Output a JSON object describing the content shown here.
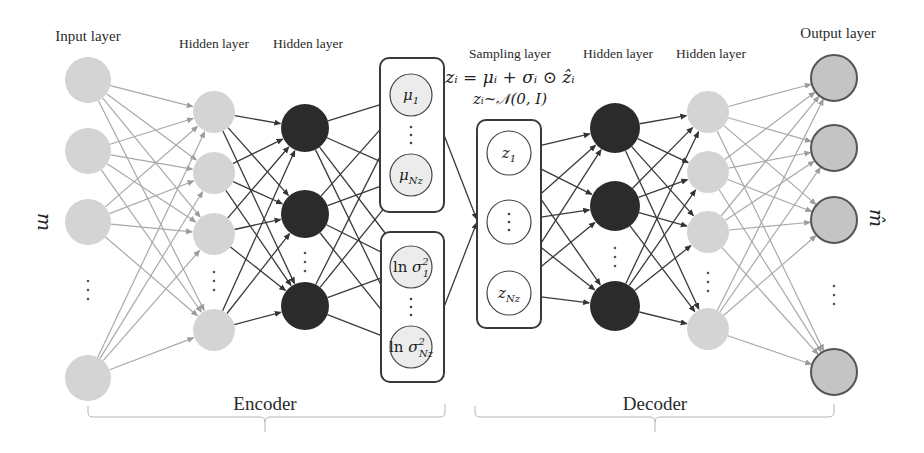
{
  "title_labels": {
    "input": "Input layer",
    "enc_hidden1": "Hidden layer",
    "enc_hidden2": "Hidden layer",
    "sampling": "Sampling layer",
    "dec_hidden1": "Hidden layer",
    "dec_hidden2": "Hidden layer",
    "output": "Output layer"
  },
  "equations": {
    "reparam": "zᵢ = μᵢ + σᵢ ⊙ ẑᵢ",
    "prior": "zᵢ~𝒩(0, I)"
  },
  "side_labels": {
    "input_symbol": "m",
    "output_symbol": "m̂"
  },
  "sections": {
    "encoder": "Encoder",
    "decoder": "Decoder"
  },
  "latent": {
    "mu": [
      {
        "base": "μ",
        "sub": "1"
      },
      {
        "base": "μ",
        "sub": "Nz"
      }
    ],
    "logvar": [
      {
        "prefix": "ln ",
        "base": "σ",
        "sub": "1",
        "sup": "2"
      },
      {
        "prefix": "ln ",
        "base": "σ",
        "sub": "Nz",
        "sup": "2"
      }
    ],
    "z": [
      {
        "base": "z",
        "sub": "1"
      },
      {
        "base": "",
        "sub": "",
        "ellipsis": true
      },
      {
        "base": "z",
        "sub": "Nz"
      }
    ]
  },
  "colors": {
    "light_node": "#d4d4d4",
    "dark_node": "#2b2b2b",
    "output_node": "#c4c4c4",
    "output_stroke": "#555555",
    "light_edge": "#a9a9a9",
    "dark_edge": "#3a3a3a",
    "latent_fill": "#ececec",
    "box_stroke": "#3a3a3a"
  },
  "network": {
    "input_nodes": 4,
    "enc_hidden1_nodes": 4,
    "enc_hidden2_nodes": 3,
    "dec_hidden1_nodes": 3,
    "dec_hidden2_nodes": 4,
    "output_nodes": 4
  }
}
